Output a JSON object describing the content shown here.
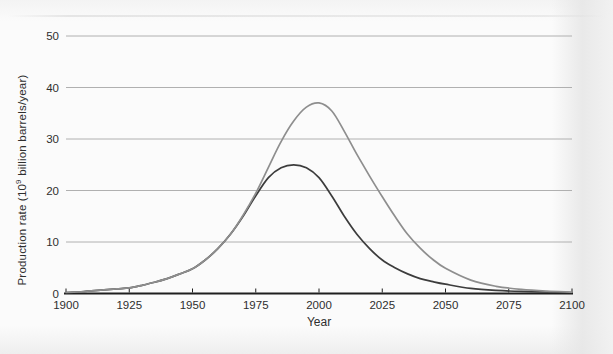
{
  "figure": {
    "background": "#fbfbfb",
    "edge_tint": "#ececec"
  },
  "chart_data": {
    "type": "line",
    "title": "",
    "xlabel": "Year",
    "ylabel": "Production rate (10⁹ billion barrels/year)",
    "ylabel_parts": {
      "prefix": "Production rate (10",
      "sup": "9",
      "suffix": " billion barrels/year)"
    },
    "xlim": [
      1900,
      2100
    ],
    "ylim": [
      0,
      50
    ],
    "x_ticks": [
      1900,
      1925,
      1950,
      1975,
      2000,
      2025,
      2050,
      2075,
      2100
    ],
    "y_ticks": [
      0,
      10,
      20,
      30,
      40,
      50
    ],
    "grid": "horizontal-only",
    "legend": "none",
    "axis_color": "#1f1f1f",
    "grid_color": "#b0b0b0",
    "label_color": "#2e2e2e",
    "series": [
      {
        "name": "lower-production-scenario",
        "color": "#3c3c3c",
        "peak": {
          "year": 1990,
          "value": 25
        },
        "points": [
          [
            1900,
            0.2
          ],
          [
            1905,
            0.3
          ],
          [
            1910,
            0.5
          ],
          [
            1915,
            0.7
          ],
          [
            1920,
            0.9
          ],
          [
            1925,
            1.1
          ],
          [
            1930,
            1.6
          ],
          [
            1935,
            2.2
          ],
          [
            1940,
            2.9
          ],
          [
            1945,
            3.8
          ],
          [
            1950,
            4.8
          ],
          [
            1955,
            6.5
          ],
          [
            1960,
            8.7
          ],
          [
            1965,
            11.5
          ],
          [
            1970,
            15.0
          ],
          [
            1975,
            19.0
          ],
          [
            1980,
            22.5
          ],
          [
            1985,
            24.4
          ],
          [
            1990,
            25.0
          ],
          [
            1995,
            24.4
          ],
          [
            2000,
            22.5
          ],
          [
            2005,
            19.0
          ],
          [
            2010,
            15.0
          ],
          [
            2015,
            11.5
          ],
          [
            2020,
            8.7
          ],
          [
            2025,
            6.5
          ],
          [
            2030,
            5.0
          ],
          [
            2035,
            3.8
          ],
          [
            2040,
            2.9
          ],
          [
            2045,
            2.3
          ],
          [
            2050,
            1.8
          ],
          [
            2060,
            1.0
          ],
          [
            2070,
            0.6
          ],
          [
            2080,
            0.4
          ],
          [
            2090,
            0.3
          ],
          [
            2100,
            0.2
          ]
        ]
      },
      {
        "name": "upper-production-scenario",
        "color": "#8e8e8e",
        "peak": {
          "year": 2000,
          "value": 37
        },
        "points": [
          [
            1900,
            0.2
          ],
          [
            1905,
            0.3
          ],
          [
            1910,
            0.5
          ],
          [
            1915,
            0.7
          ],
          [
            1920,
            0.9
          ],
          [
            1925,
            1.1
          ],
          [
            1930,
            1.6
          ],
          [
            1935,
            2.2
          ],
          [
            1940,
            2.9
          ],
          [
            1945,
            3.8
          ],
          [
            1950,
            4.8
          ],
          [
            1955,
            6.5
          ],
          [
            1960,
            8.7
          ],
          [
            1965,
            11.5
          ],
          [
            1970,
            15.2
          ],
          [
            1975,
            19.5
          ],
          [
            1980,
            24.5
          ],
          [
            1985,
            29.5
          ],
          [
            1990,
            33.5
          ],
          [
            1995,
            36.2
          ],
          [
            2000,
            37.0
          ],
          [
            2005,
            35.5
          ],
          [
            2010,
            31.5
          ],
          [
            2015,
            27.0
          ],
          [
            2020,
            22.8
          ],
          [
            2025,
            18.8
          ],
          [
            2030,
            15.0
          ],
          [
            2035,
            11.5
          ],
          [
            2040,
            8.8
          ],
          [
            2045,
            6.6
          ],
          [
            2050,
            4.9
          ],
          [
            2060,
            2.6
          ],
          [
            2070,
            1.4
          ],
          [
            2080,
            0.8
          ],
          [
            2090,
            0.45
          ],
          [
            2100,
            0.25
          ]
        ]
      }
    ]
  }
}
